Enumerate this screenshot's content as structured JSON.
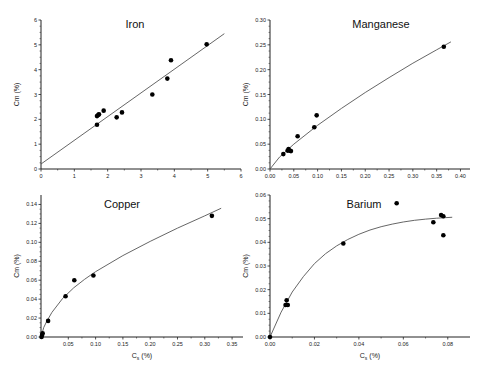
{
  "chart_data": [
    {
      "type": "scatter",
      "title": "Iron",
      "xlabel": "",
      "ylabel": "Cm (%)",
      "xlim": [
        0,
        6
      ],
      "ylim": [
        0,
        6
      ],
      "xticks": [
        0,
        1,
        2,
        3,
        4,
        5,
        6
      ],
      "yticks": [
        0,
        1,
        2,
        3,
        4,
        5,
        6
      ],
      "grid": false,
      "points": [
        {
          "x": 1.68,
          "y": 1.78
        },
        {
          "x": 1.68,
          "y": 2.13
        },
        {
          "x": 1.72,
          "y": 2.18
        },
        {
          "x": 1.74,
          "y": 2.2
        },
        {
          "x": 1.88,
          "y": 2.35
        },
        {
          "x": 2.27,
          "y": 2.08
        },
        {
          "x": 2.43,
          "y": 2.28
        },
        {
          "x": 3.34,
          "y": 3.0
        },
        {
          "x": 3.79,
          "y": 3.64
        },
        {
          "x": 3.9,
          "y": 4.38
        },
        {
          "x": 4.97,
          "y": 5.02
        }
      ],
      "fit": {
        "kind": "linear",
        "x": [
          0,
          5.5
        ],
        "y": [
          0.2,
          5.45
        ]
      }
    },
    {
      "type": "scatter",
      "title": "Manganese",
      "xlabel": "",
      "ylabel": "Cm (%)",
      "xlim": [
        0,
        0.42
      ],
      "ylim": [
        0,
        0.3
      ],
      "xticks": [
        0.0,
        0.05,
        0.1,
        0.15,
        0.2,
        0.25,
        0.3,
        0.35,
        0.4
      ],
      "yticks": [
        0.0,
        0.05,
        0.1,
        0.15,
        0.2,
        0.25,
        0.3
      ],
      "grid": false,
      "points": [
        {
          "x": 0.028,
          "y": 0.03
        },
        {
          "x": 0.037,
          "y": 0.037
        },
        {
          "x": 0.039,
          "y": 0.04
        },
        {
          "x": 0.041,
          "y": 0.037
        },
        {
          "x": 0.044,
          "y": 0.036
        },
        {
          "x": 0.058,
          "y": 0.066
        },
        {
          "x": 0.093,
          "y": 0.084
        },
        {
          "x": 0.098,
          "y": 0.108
        },
        {
          "x": 0.365,
          "y": 0.246
        }
      ],
      "fit": {
        "kind": "power",
        "x": [
          0,
          0.02,
          0.05,
          0.1,
          0.15,
          0.2,
          0.25,
          0.3,
          0.35,
          0.38
        ],
        "y": [
          0,
          0.024,
          0.05,
          0.088,
          0.122,
          0.154,
          0.184,
          0.213,
          0.24,
          0.256
        ]
      }
    },
    {
      "type": "scatter",
      "title": "Copper",
      "xlabel": "C_s (%)",
      "ylabel": "Cm (%)",
      "xlim": [
        0,
        0.37
      ],
      "ylim": [
        0,
        0.15
      ],
      "xticks": [
        0.05,
        0.1,
        0.15,
        0.2,
        0.25,
        0.3,
        0.35
      ],
      "yticks": [
        0.0,
        0.02,
        0.04,
        0.06,
        0.08,
        0.1,
        0.12,
        0.14
      ],
      "grid": false,
      "points": [
        {
          "x": 0.001,
          "y": 0.0
        },
        {
          "x": 0.002,
          "y": 0.002
        },
        {
          "x": 0.003,
          "y": 0.004
        },
        {
          "x": 0.013,
          "y": 0.017
        },
        {
          "x": 0.045,
          "y": 0.043
        },
        {
          "x": 0.061,
          "y": 0.06
        },
        {
          "x": 0.096,
          "y": 0.065
        },
        {
          "x": 0.313,
          "y": 0.128
        }
      ],
      "fit": {
        "kind": "power",
        "x": [
          0,
          0.005,
          0.01,
          0.02,
          0.04,
          0.06,
          0.08,
          0.1,
          0.15,
          0.2,
          0.25,
          0.3,
          0.33
        ],
        "y": [
          0,
          0.01,
          0.016,
          0.026,
          0.041,
          0.052,
          0.061,
          0.069,
          0.086,
          0.101,
          0.115,
          0.128,
          0.136
        ]
      }
    },
    {
      "type": "scatter",
      "title": "Barium",
      "xlabel": "C_s (%)",
      "ylabel": "Cm (%)",
      "xlim": [
        0,
        0.09
      ],
      "ylim": [
        0,
        0.06
      ],
      "xticks": [
        0.0,
        0.02,
        0.04,
        0.06,
        0.08
      ],
      "yticks": [
        0.0,
        0.01,
        0.02,
        0.03,
        0.04,
        0.05,
        0.06
      ],
      "grid": false,
      "points": [
        {
          "x": 0.0,
          "y": 0.0
        },
        {
          "x": 0.007,
          "y": 0.0135
        },
        {
          "x": 0.0075,
          "y": 0.0155
        },
        {
          "x": 0.008,
          "y": 0.0135
        },
        {
          "x": 0.033,
          "y": 0.0395
        },
        {
          "x": 0.057,
          "y": 0.0565
        },
        {
          "x": 0.0735,
          "y": 0.0485
        },
        {
          "x": 0.077,
          "y": 0.0515
        },
        {
          "x": 0.078,
          "y": 0.051
        },
        {
          "x": 0.078,
          "y": 0.043
        }
      ],
      "fit": {
        "kind": "exponential",
        "x": [
          0,
          0.005,
          0.01,
          0.015,
          0.02,
          0.025,
          0.03,
          0.035,
          0.04,
          0.045,
          0.05,
          0.055,
          0.06,
          0.065,
          0.07,
          0.075,
          0.082
        ],
        "y": [
          0,
          0.0105,
          0.019,
          0.0255,
          0.031,
          0.0352,
          0.0385,
          0.0412,
          0.0434,
          0.0452,
          0.0466,
          0.0477,
          0.0486,
          0.0493,
          0.0498,
          0.0502,
          0.0506
        ]
      }
    }
  ],
  "layout": {
    "panels": [
      {
        "left": 41,
        "right": 241,
        "top": 20,
        "bottom": 169
      },
      {
        "left": 270,
        "right": 470,
        "top": 20,
        "bottom": 169
      },
      {
        "left": 41,
        "right": 243,
        "top": 195,
        "bottom": 337
      },
      {
        "left": 270,
        "right": 470,
        "top": 195,
        "bottom": 337
      }
    ],
    "title_pos": [
      {
        "x": 135,
        "y": 28
      },
      {
        "x": 381,
        "y": 28
      },
      {
        "x": 122,
        "y": 208
      },
      {
        "x": 364,
        "y": 208
      }
    ],
    "tick_decimals": [
      {
        "x": 0,
        "y": 0
      },
      {
        "x": 2,
        "y": 2
      },
      {
        "x": 2,
        "y": 2
      },
      {
        "x": 2,
        "y": 2
      }
    ],
    "colors": {
      "axis": "#222222",
      "point": "#000000",
      "fit": "#555555"
    }
  }
}
